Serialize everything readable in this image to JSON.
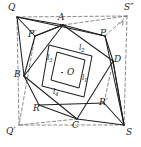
{
  "figure": {
    "stroke_color": "#1f1f1f",
    "dash_color": "#6b6b6b",
    "background": "#ffffff",
    "width": 141,
    "height": 147,
    "center_point": {
      "name": "O",
      "label": "O",
      "x": 67,
      "y": 68,
      "has_dot": true
    },
    "outer_vertices": [
      {
        "name": "Q",
        "label": "Q",
        "x": 17,
        "y": 17,
        "label_x": 8,
        "label_y": 3
      },
      {
        "name": "S2",
        "label": "S″",
        "x": 127,
        "y": 16,
        "label_x": 124,
        "label_y": 3
      },
      {
        "name": "S",
        "label": "S",
        "x": 124,
        "y": 125,
        "label_x": 126,
        "label_y": 128
      },
      {
        "name": "Q2",
        "label": "Q′",
        "x": 19,
        "y": 125,
        "label_x": 6,
        "label_y": 127
      }
    ],
    "quad_vertices": [
      {
        "name": "A",
        "label": "A",
        "x": 63,
        "y": 25,
        "label_x": 58,
        "label_y": 13
      },
      {
        "name": "D",
        "label": "D",
        "x": 113,
        "y": 61,
        "label_x": 114,
        "label_y": 55
      },
      {
        "name": "C",
        "label": "C",
        "x": 77,
        "y": 119,
        "label_x": 72,
        "label_y": 121
      },
      {
        "name": "B",
        "label": "B",
        "x": 24,
        "y": 76,
        "label_x": 14,
        "label_y": 70
      }
    ],
    "aux_points": [
      {
        "name": "P",
        "label": "P",
        "x": 105,
        "y": 36,
        "label_x": 100,
        "label_y": 29
      },
      {
        "name": "Pp",
        "label": "P′",
        "x": 35,
        "y": 36,
        "label_x": 28,
        "label_y": 30
      },
      {
        "name": "R",
        "label": "R",
        "x": 39,
        "y": 105,
        "label_x": 33,
        "label_y": 104
      },
      {
        "name": "Rp",
        "label": "R′",
        "x": 104,
        "y": 103,
        "label_x": 99,
        "label_y": 98
      }
    ],
    "inner_segment_labels": [
      {
        "name": "l1",
        "label": "l",
        "sub": "1",
        "x": 82,
        "y": 74
      },
      {
        "name": "l2",
        "label": "l",
        "sub": "2",
        "x": 79,
        "y": 44
      },
      {
        "name": "l3",
        "label": "l",
        "sub": "3",
        "x": 47,
        "y": 54
      },
      {
        "name": "l4",
        "label": "l",
        "sub": "4",
        "x": 53,
        "y": 88
      }
    ],
    "solid_edges": [
      [
        17,
        17,
        63,
        25
      ],
      [
        17,
        17,
        24,
        76
      ],
      [
        17,
        17,
        105,
        36
      ],
      [
        17,
        17,
        35,
        36
      ],
      [
        63,
        25,
        105,
        36
      ],
      [
        63,
        25,
        35,
        36
      ],
      [
        63,
        25,
        113,
        61
      ],
      [
        63,
        25,
        24,
        76
      ],
      [
        105,
        36,
        113,
        61
      ],
      [
        113,
        61,
        124,
        125
      ],
      [
        113,
        61,
        77,
        119
      ],
      [
        124,
        125,
        77,
        119
      ],
      [
        124,
        125,
        104,
        103
      ],
      [
        124,
        125,
        113,
        61
      ],
      [
        77,
        119,
        39,
        105
      ],
      [
        77,
        119,
        24,
        76
      ],
      [
        39,
        105,
        24,
        76
      ],
      [
        24,
        76,
        35,
        36
      ],
      [
        35,
        36,
        63,
        25
      ],
      [
        39,
        105,
        104,
        103
      ],
      [
        105,
        36,
        124,
        125
      ]
    ],
    "square_edges": [
      [
        49,
        45,
        92,
        56
      ],
      [
        92,
        56,
        84,
        97
      ],
      [
        84,
        97,
        42,
        86
      ],
      [
        42,
        86,
        49,
        45
      ]
    ],
    "inner_square_edges": [
      [
        57,
        52,
        85,
        60
      ],
      [
        85,
        60,
        79,
        88
      ],
      [
        79,
        88,
        51,
        80
      ],
      [
        51,
        80,
        57,
        52
      ]
    ],
    "dashed_edges": [
      [
        17,
        17,
        127,
        16
      ],
      [
        127,
        16,
        124,
        125
      ],
      [
        124,
        125,
        19,
        125
      ],
      [
        19,
        125,
        17,
        17
      ],
      [
        35,
        36,
        19,
        125
      ],
      [
        105,
        36,
        127,
        16
      ],
      [
        113,
        61,
        104,
        103
      ],
      [
        63,
        25,
        127,
        16
      ],
      [
        19,
        125,
        77,
        119
      ]
    ],
    "arrowheads": [
      {
        "name": "arrow-to-S2",
        "x": 123,
        "y": 21,
        "angle": -62
      }
    ]
  }
}
